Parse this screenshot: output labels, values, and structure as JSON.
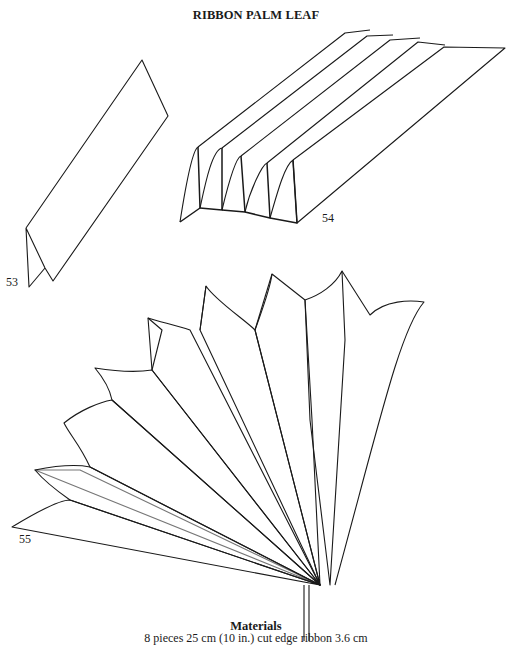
{
  "page": {
    "title": "RIBBON PALM LEAF"
  },
  "figures": [
    {
      "number": "53",
      "description": "single folded ribbon strip"
    },
    {
      "number": "54",
      "description": "accordion-pleated ribbon strips"
    },
    {
      "number": "55",
      "description": "fanned palm leaf with cross-hatched pleats"
    }
  ],
  "materials": {
    "heading": "Materials",
    "line": "8 pieces 25 cm (10 in.) cut edge ribbon 3.6 cm"
  }
}
